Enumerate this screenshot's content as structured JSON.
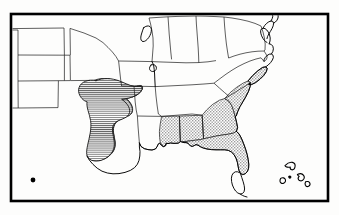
{
  "figure": {
    "type": "distribution-range-map",
    "region": "Central and Southeastern United States",
    "title": "",
    "caption": "",
    "width": 339,
    "height": 215
  },
  "colors": {
    "background": "#fdfdfc",
    "frame_stroke": "#000000",
    "coastline_stroke": "#000000",
    "state_border_stroke": "#1a1a1a",
    "hatch_fill_line": "#3a3a3a",
    "stipple_fill": "#c9c9c9",
    "stipple_dot": "#8a8a8a",
    "unshaded_land": "#ffffff",
    "point_marker": "#000000"
  },
  "frame": {
    "name": "map-border",
    "x": 11,
    "y": 14,
    "width": 317,
    "height": 187,
    "stroke_width": 2.6
  },
  "legend_patterns": [
    {
      "id": "hatch",
      "label": "horizontal-line-hatching",
      "description": "Horizontal ruled lines marking the western range area over Texas and southern Oklahoma"
    },
    {
      "id": "stipple",
      "label": "gray-stipple-shading",
      "description": "Fine dotted gray shading marking the southeastern range across the Gulf Coast and South Atlantic states"
    }
  ],
  "shaded_regions": [
    {
      "name": "western-hatched-range",
      "pattern": "hatch",
      "states": [
        "Texas",
        "Oklahoma"
      ]
    },
    {
      "name": "southeastern-stippled-range",
      "pattern": "stipple",
      "states": [
        "Mississippi",
        "Alabama",
        "Georgia",
        "Florida",
        "South Carolina",
        "North Carolina"
      ]
    }
  ],
  "unshaded_states": [
    "Colorado",
    "Kansas",
    "Nebraska",
    "New Mexico",
    "Missouri",
    "Arkansas",
    "Louisiana",
    "Iowa",
    "Illinois",
    "Indiana",
    "Ohio",
    "Kentucky",
    "Tennessee",
    "West Virginia",
    "Virginia",
    "Maryland",
    "Delaware"
  ],
  "point_markers": [
    {
      "name": "isolated-locality-point",
      "x": 33,
      "y": 180,
      "radius": 2.4
    }
  ],
  "islands": [
    {
      "name": "bahamas-island-north"
    },
    {
      "name": "bahamas-island-andros"
    },
    {
      "name": "bahamas-island-small"
    },
    {
      "name": "bahamas-island-east"
    }
  ],
  "water_features": [
    {
      "name": "lake-michigan"
    },
    {
      "name": "chesapeake-bay"
    },
    {
      "name": "gulf-of-mexico"
    },
    {
      "name": "atlantic-ocean"
    }
  ]
}
